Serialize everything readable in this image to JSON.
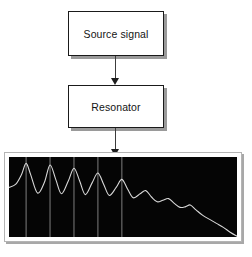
{
  "diagram": {
    "nodes": [
      {
        "id": "source",
        "label": "Source signal"
      },
      {
        "id": "resonator",
        "label": "Resonator"
      }
    ],
    "arrows": [
      {
        "id": "arrow-source-to-resonator",
        "from": "source",
        "to": "resonator"
      },
      {
        "id": "arrow-resonator-to-plot",
        "from": "resonator",
        "to": "spectrum-plot"
      }
    ],
    "colors": {
      "box_fill": "#ffffff",
      "box_border": "#1a1a1a",
      "box_shadow": "#9a9a9a",
      "arrow": "#1d1d1d",
      "plot_background": "#050505",
      "plot_border": "#ffffff",
      "trace": "#d8d8d8",
      "gridline": "#8c8c8c"
    }
  },
  "chart_data": {
    "type": "line",
    "title": "",
    "xlabel": "",
    "ylabel": "",
    "xlim": [
      0,
      100
    ],
    "ylim": [
      0,
      100
    ],
    "grid": true,
    "grid_orientation": "vertical",
    "legend": "none",
    "background": "dark",
    "gridline_x": [
      7.5,
      18.0,
      28.5,
      39.0,
      49.5
    ],
    "peaks": [
      {
        "x": 7.5,
        "y": 92
      },
      {
        "x": 18.0,
        "y": 90
      },
      {
        "x": 28.5,
        "y": 86
      },
      {
        "x": 39.0,
        "y": 80
      },
      {
        "x": 49.5,
        "y": 72
      },
      {
        "x": 60.0,
        "y": 58
      },
      {
        "x": 70.0,
        "y": 48
      },
      {
        "x": 79.5,
        "y": 40
      }
    ],
    "troughs": [
      {
        "x": 12.5,
        "y": 55
      },
      {
        "x": 23.0,
        "y": 54
      },
      {
        "x": 33.5,
        "y": 53
      },
      {
        "x": 44.0,
        "y": 52
      },
      {
        "x": 54.5,
        "y": 49
      },
      {
        "x": 65.0,
        "y": 44
      },
      {
        "x": 75.0,
        "y": 37
      },
      {
        "x": 85.0,
        "y": 27
      }
    ],
    "x": [
      0,
      3,
      5.5,
      7.5,
      9.5,
      12.5,
      15.5,
      18,
      20.5,
      23,
      26,
      28.5,
      31,
      33.5,
      36.5,
      39,
      41.5,
      44,
      47,
      49.5,
      52,
      54.5,
      57.5,
      60,
      62.5,
      65,
      67.5,
      70,
      72.5,
      75,
      77.5,
      79.5,
      82,
      85,
      88,
      91,
      94,
      97,
      100
    ],
    "y": [
      62,
      66,
      78,
      92,
      78,
      55,
      68,
      90,
      72,
      54,
      70,
      86,
      70,
      53,
      68,
      80,
      66,
      52,
      62,
      72,
      60,
      49,
      54,
      58,
      50,
      44,
      46,
      48,
      42,
      37,
      38,
      40,
      34,
      27,
      22,
      17,
      12,
      6,
      1
    ]
  }
}
